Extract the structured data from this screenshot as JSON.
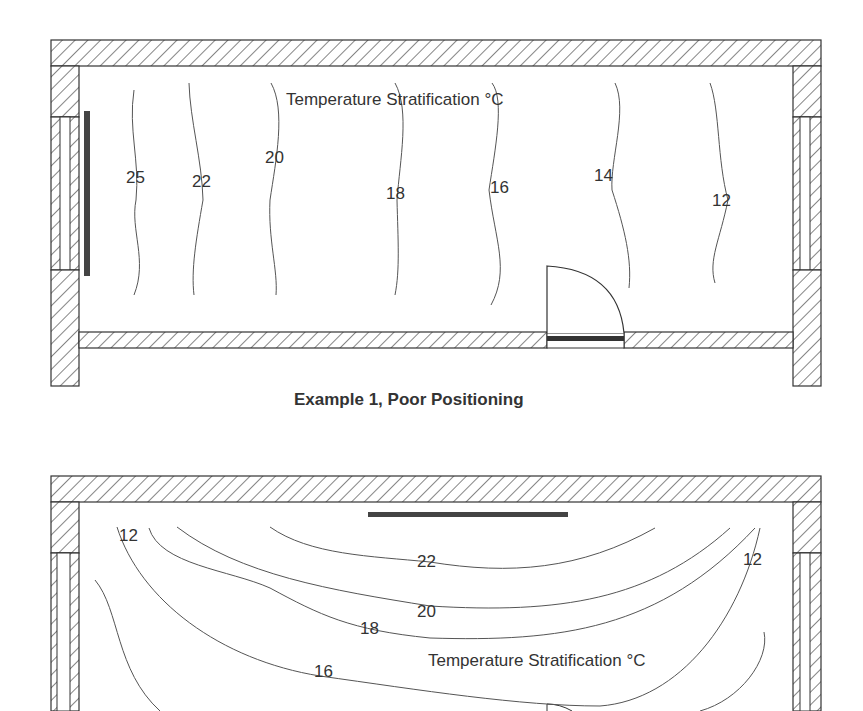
{
  "figure1": {
    "title": "Temperature Stratification °C",
    "caption": "Example 1, Poor Positioning",
    "isotherms": [
      "25",
      "22",
      "20",
      "18",
      "16",
      "14",
      "12"
    ],
    "heater_position": "under left window (vertical)"
  },
  "figure2": {
    "title": "Temperature Stratification °C",
    "isotherms": [
      "12",
      "22",
      "20",
      "18",
      "16",
      "12"
    ],
    "heater_position": "top interior wall (horizontal)"
  },
  "colors": {
    "wall_stroke": "#333333",
    "heater": "#444444",
    "isotherm": "#555555",
    "background": "#ffffff"
  }
}
